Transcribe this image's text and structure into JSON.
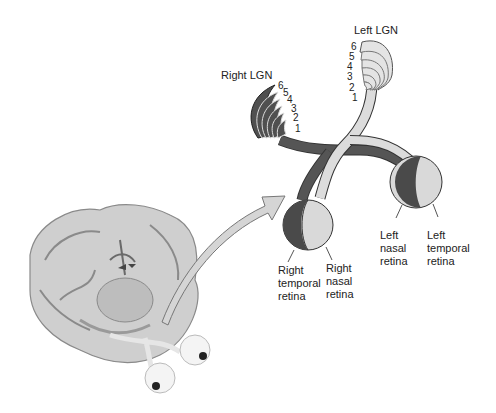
{
  "diagram": {
    "title_labels": {
      "right_lgn": "Right LGN",
      "left_lgn": "Left LGN"
    },
    "lgn_layers": [
      "1",
      "2",
      "3",
      "4",
      "5",
      "6"
    ],
    "retina_labels": {
      "right_temporal": "Right\ntemporal\nretina",
      "right_nasal": "Right\nnasal\nretina",
      "left_nasal": "Left\nnasal\nretina",
      "left_temporal": "Left\ntemporal\nretina"
    },
    "colors": {
      "dark_pathway": "#4a4a4a",
      "light_pathway": "#d8d8d8",
      "outline": "#333333",
      "brain": "#b5b5b5"
    }
  }
}
